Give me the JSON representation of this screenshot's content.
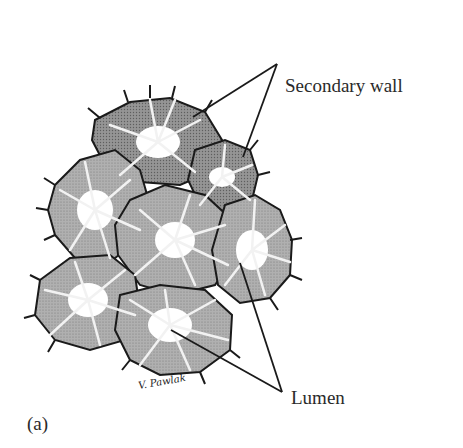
{
  "figure": {
    "panel_label": "(a)",
    "signature": "V. Pawlak",
    "labels": [
      {
        "text": "Secondary wall",
        "targets": 2
      },
      {
        "text": "Lumen",
        "targets": 2
      }
    ],
    "colors": {
      "cell_fill": "#a9a9a9",
      "cell_fill_dark": "#8e8e8e",
      "cell_fill_light": "#bdbdbd",
      "outline": "#1a1a1a",
      "pit_canal": "#f2f2f2",
      "lumen": "#ffffff"
    }
  }
}
